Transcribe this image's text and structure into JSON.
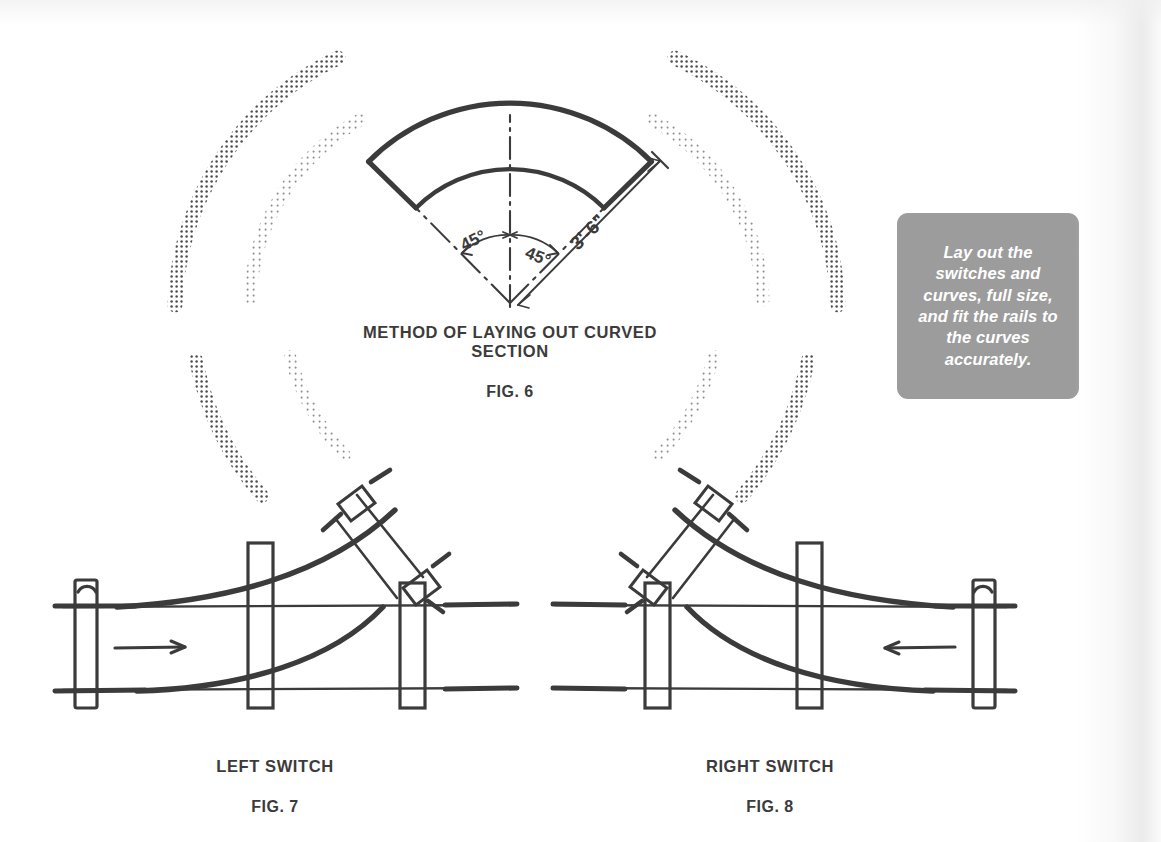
{
  "page": {
    "background_color": "#ffffff",
    "ink_color": "#3b3b3b",
    "accent_gray": "#9c9c9c"
  },
  "callout": {
    "text": "Lay out the switches and curves, full size, and fit the rails to the curves accurately.",
    "background_color": "#9c9c9c",
    "text_color": "#ffffff"
  },
  "figures": [
    {
      "id": "fig6",
      "title": "METHOD OF LAYING OUT CURVED\nSECTION",
      "label_prefix": "F",
      "label_small": "IG",
      "label_suffix": ". 6",
      "label_full": "FIG. 6",
      "annotations": {
        "angle_left": "45°",
        "angle_right": "45°",
        "radius": "3'-6\""
      }
    },
    {
      "id": "fig7",
      "title": "LEFT SWITCH",
      "label_prefix": "F",
      "label_small": "IG",
      "label_suffix": ". 7",
      "label_full": "FIG. 7",
      "direction_arrow": "right"
    },
    {
      "id": "fig8",
      "title": "RIGHT SWITCH",
      "label_prefix": "F",
      "label_small": "IG",
      "label_suffix": ". 8",
      "label_full": "FIG. 8",
      "direction_arrow": "left"
    }
  ],
  "decoration": {
    "halftone_arcs_count": 8,
    "halftone_color": "#555555",
    "description": "dotted halftone arc swooshes framing Fig. 6"
  }
}
